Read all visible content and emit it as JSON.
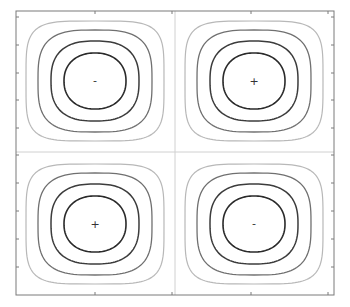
{
  "chart_data": {
    "type": "contour",
    "title": "",
    "xlabel": "",
    "ylabel": "",
    "grid": false,
    "legend": null,
    "frame": {
      "x0": 16,
      "y0": 11,
      "x1": 334,
      "y1": 295
    },
    "zero_lines": {
      "x": 175,
      "y": 152,
      "color": "#d0d0d0"
    },
    "ticks": {
      "left": [
        17,
        45,
        73,
        100,
        128,
        155,
        183,
        211,
        239,
        267
      ],
      "right": [
        17,
        45,
        73,
        100,
        128,
        155,
        183,
        211,
        239,
        267
      ],
      "top": [
        95,
        172,
        251,
        328
      ],
      "bottom": [
        95,
        172,
        251,
        328
      ]
    },
    "levels": [
      {
        "rx": 31,
        "ry": 28,
        "n": 2.2,
        "color": "#2a2a2a",
        "width": 1.6
      },
      {
        "rx": 44,
        "ry": 40,
        "n": 2.6,
        "color": "#3c3c3c",
        "width": 1.5
      },
      {
        "rx": 57,
        "ry": 51,
        "n": 3.2,
        "color": "#707070",
        "width": 1.3
      },
      {
        "rx": 69,
        "ry": 60,
        "n": 4.5,
        "color": "#b8b8b8",
        "width": 1.2
      }
    ],
    "cells": [
      {
        "name": "top-left",
        "cx": 95,
        "cy": 81,
        "sign": "-"
      },
      {
        "name": "top-right",
        "cx": 254,
        "cy": 81,
        "sign": "+"
      },
      {
        "name": "bottom-left",
        "cx": 95,
        "cy": 224,
        "sign": "+"
      },
      {
        "name": "bottom-right",
        "cx": 254,
        "cy": 224,
        "sign": "-"
      }
    ]
  },
  "markers": {
    "top_left": "-",
    "top_right": "+",
    "bottom_left": "+",
    "bottom_right": "-"
  }
}
